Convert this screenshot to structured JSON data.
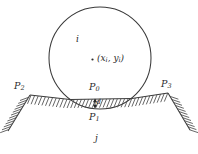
{
  "figure": {
    "type": "contact-mechanics-diagram",
    "caption": "",
    "colors": {
      "stroke": "#3a3a3a",
      "hatch": "#4a4a4a",
      "text": "#2b2b2b",
      "background": "#ffffff"
    }
  },
  "particle": {
    "label": "i",
    "center_label_prefix": "(",
    "center_label": "(x",
    "shape": "circle",
    "center": {
      "x": 100,
      "y": 58
    },
    "radius": 51,
    "center_marker": "dot"
  },
  "coordinate_label": {
    "open_paren": "(",
    "x_symbol": "x",
    "x_subscript": "i",
    "comma": ", ",
    "y_symbol": "y",
    "y_subscript": "i",
    "close_paren": ")",
    "full_text": "(xi, yi)"
  },
  "boundary": {
    "label": "j",
    "type": "hatched-surface"
  },
  "points": [
    {
      "id": "P0",
      "letter": "P",
      "subscript": "0",
      "x": 95,
      "y": 96,
      "description": "contact point on boundary surface"
    },
    {
      "id": "P1",
      "letter": "P",
      "subscript": "1",
      "x": 95,
      "y": 108,
      "description": "lowest point of particle"
    },
    {
      "id": "P2",
      "letter": "P",
      "subscript": "2",
      "x": 30,
      "y": 95,
      "description": "left boundary vertex"
    },
    {
      "id": "P3",
      "letter": "P",
      "subscript": "3",
      "x": 168,
      "y": 93,
      "description": "right boundary vertex"
    }
  ],
  "overlap": {
    "symbol": "d",
    "description": "penetration depth between P0 and P1",
    "arrow": "double-headed-vertical"
  }
}
